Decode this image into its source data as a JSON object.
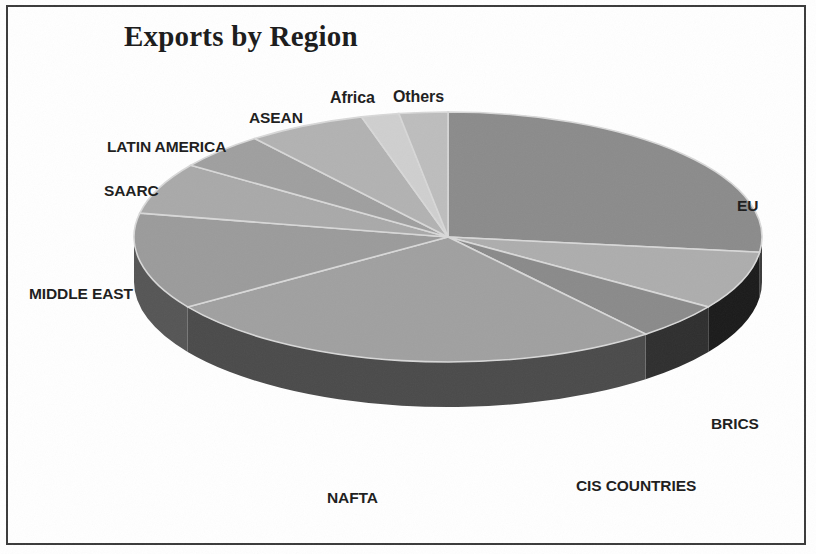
{
  "chart_data": {
    "type": "pie",
    "title": "Exports by Region",
    "three_d": true,
    "start_angle_deg": 0,
    "direction": "clockwise",
    "labels": [
      "EU",
      "BRICS",
      "CIS COUNTRIES",
      "NAFTA",
      "MIDDLE EAST",
      "SAARC",
      "LATIN AMERICA",
      "ASEAN",
      "Africa",
      "Others"
    ],
    "values": [
      27.0,
      7.5,
      4.7,
      26.4,
      12.5,
      6.7,
      4.7,
      6.1,
      1.9,
      2.5
    ],
    "value_unit": "percent of total exports",
    "slice_angles_deg": [
      97,
      27,
      17,
      95,
      45,
      24,
      17,
      22,
      7,
      9
    ],
    "colors": [
      "#8b8b8b",
      "#adadad",
      "#8a8a8a",
      "#a0a0a0",
      "#9b9b9b",
      "#a9a9a9",
      "#9f9f9f",
      "#b2b2b2",
      "#cfcfcf",
      "#bdbdbd"
    ],
    "side_colors": [
      "#3a3a3a",
      "#1a1a1a",
      "#2e2e2e",
      "#4a4a4a",
      "#555555",
      "#5a5a5a",
      "#5a5a5a",
      "#5a5a5a",
      "#5a5a5a",
      "#5a5a5a"
    ],
    "legend": "none",
    "labels_position": "outside",
    "xlabel": "",
    "ylabel": ""
  },
  "chart": {
    "title": "Exports by Region",
    "labels": {
      "eu": "EU",
      "brics": "BRICS",
      "cis_countries": "CIS COUNTRIES",
      "nafta": "NAFTA",
      "middle_east": "MIDDLE EAST",
      "saarc": "SAARC",
      "latin_america": "LATIN AMERICA",
      "asean": "ASEAN",
      "africa": "Africa",
      "others": "Others"
    }
  },
  "style": {
    "background": "#ffffff",
    "frame_color": "#3a3a3a",
    "text_color": "#1c1c1c"
  }
}
